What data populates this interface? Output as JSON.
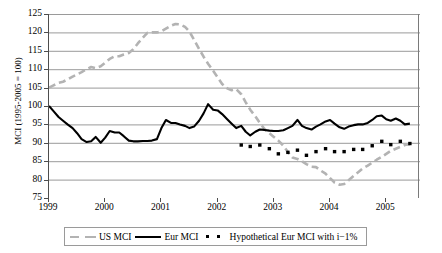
{
  "chart_data": {
    "type": "line",
    "title": "",
    "xlabel": "",
    "ylabel": "MCI (1995-2005 = 100)",
    "xlim": [
      1999,
      2005.6
    ],
    "ylim": [
      75,
      125
    ],
    "ytick_step": 5,
    "yticks": [
      125,
      120,
      115,
      110,
      105,
      100,
      95,
      90,
      85,
      80,
      75
    ],
    "xticks": [
      1999,
      2000,
      2001,
      2002,
      2003,
      2004,
      2005
    ],
    "grid": "horizontal",
    "legend_position": "bottom",
    "colors": {
      "us_mci": "#b3b3b3",
      "eur_mci": "#000000",
      "hypothetical": "#000000",
      "gridline": "#808080",
      "axis": "#4d4d4d"
    },
    "series": [
      {
        "name": "US MCI",
        "style": "dashed",
        "color": "#b3b3b3",
        "x": [
          1999.0,
          1999.08,
          1999.17,
          1999.25,
          1999.33,
          1999.42,
          1999.5,
          1999.58,
          1999.67,
          1999.75,
          1999.83,
          1999.92,
          2000.0,
          2000.08,
          2000.17,
          2000.25,
          2000.33,
          2000.42,
          2000.5,
          2000.58,
          2000.67,
          2000.75,
          2000.83,
          2000.92,
          2001.0,
          2001.08,
          2001.17,
          2001.25,
          2001.33,
          2001.42,
          2001.5,
          2001.58,
          2001.67,
          2001.75,
          2001.83,
          2001.92,
          2002.0,
          2002.08,
          2002.17,
          2002.25,
          2002.33,
          2002.42,
          2002.5,
          2002.58,
          2002.67,
          2002.75,
          2002.83,
          2002.92,
          2003.0,
          2003.08,
          2003.17,
          2003.25,
          2003.33,
          2003.42,
          2003.5,
          2003.58,
          2003.67,
          2003.75,
          2003.83,
          2003.92,
          2004.0,
          2004.08,
          2004.17,
          2004.25,
          2004.33,
          2004.42,
          2004.5,
          2004.58,
          2004.67,
          2004.75,
          2004.83,
          2004.92,
          2005.0,
          2005.08,
          2005.17,
          2005.25,
          2005.33,
          2005.42
        ],
        "values": [
          105.0,
          105.6,
          106.3,
          106.6,
          107.2,
          108.0,
          108.6,
          109.2,
          110.0,
          110.6,
          110.3,
          110.8,
          111.8,
          112.8,
          113.5,
          113.5,
          114.0,
          114.4,
          115.4,
          117.0,
          118.6,
          119.9,
          120.0,
          120.0,
          120.3,
          121.0,
          121.8,
          122.3,
          122.2,
          121.5,
          120.2,
          118.0,
          115.5,
          113.4,
          111.5,
          109.6,
          107.8,
          106.0,
          104.8,
          104.3,
          104.6,
          103.2,
          101.0,
          99.0,
          97.2,
          95.4,
          93.8,
          92.6,
          91.6,
          90.6,
          89.2,
          87.5,
          86.0,
          85.6,
          85.0,
          84.2,
          83.5,
          83.4,
          82.5,
          81.6,
          80.4,
          79.2,
          78.6,
          78.8,
          79.8,
          81.0,
          82.0,
          83.0,
          83.8,
          84.6,
          85.4,
          86.2,
          87.0,
          87.8,
          88.4,
          88.9,
          89.4,
          89.6
        ]
      },
      {
        "name": "Eur MCI",
        "style": "solid",
        "color": "#000000",
        "x": [
          1999.0,
          1999.08,
          1999.17,
          1999.25,
          1999.33,
          1999.42,
          1999.5,
          1999.58,
          1999.67,
          1999.75,
          1999.83,
          1999.92,
          2000.0,
          2000.08,
          2000.17,
          2000.25,
          2000.33,
          2000.42,
          2000.5,
          2000.58,
          2000.67,
          2000.75,
          2000.83,
          2000.92,
          2001.0,
          2001.08,
          2001.17,
          2001.25,
          2001.33,
          2001.42,
          2001.5,
          2001.58,
          2001.67,
          2001.75,
          2001.83,
          2001.92,
          2002.0,
          2002.08,
          2002.17,
          2002.25,
          2002.33,
          2002.42,
          2002.5,
          2002.58,
          2002.67,
          2002.75,
          2002.83,
          2002.92,
          2003.0,
          2003.08,
          2003.17,
          2003.25,
          2003.33,
          2003.42,
          2003.5,
          2003.58,
          2003.67,
          2003.75,
          2003.83,
          2003.92,
          2004.0,
          2004.08,
          2004.17,
          2004.25,
          2004.33,
          2004.42,
          2004.5,
          2004.58,
          2004.67,
          2004.75,
          2004.83,
          2004.92,
          2005.0,
          2005.08,
          2005.17,
          2005.25,
          2005.33,
          2005.42
        ],
        "values": [
          100.0,
          98.6,
          97.0,
          96.0,
          95.0,
          94.0,
          92.6,
          91.0,
          90.2,
          90.4,
          91.6,
          90.0,
          91.4,
          93.2,
          92.8,
          92.8,
          91.8,
          90.6,
          90.4,
          90.4,
          90.5,
          90.5,
          90.6,
          91.0,
          94.0,
          96.2,
          95.4,
          95.4,
          95.0,
          94.6,
          94.0,
          94.4,
          96.0,
          98.0,
          100.5,
          99.0,
          98.8,
          97.8,
          96.4,
          95.2,
          94.0,
          94.6,
          93.0,
          92.0,
          93.0,
          93.6,
          93.5,
          93.3,
          93.2,
          93.2,
          93.4,
          94.0,
          94.6,
          96.2,
          94.6,
          94.0,
          93.6,
          94.4,
          95.0,
          95.8,
          96.2,
          95.2,
          94.2,
          93.8,
          94.4,
          94.8,
          95.0,
          95.0,
          95.4,
          96.2,
          97.2,
          97.4,
          96.4,
          96.0,
          96.6,
          96.0,
          95.0,
          95.2
        ]
      },
      {
        "name": "Hypothetical Eur MCI with i−1%",
        "style": "dotted",
        "color": "#000000",
        "x": [
          2002.42,
          2002.5,
          2002.58,
          2002.67,
          2002.75,
          2002.83,
          2002.92,
          2003.0,
          2003.08,
          2003.17,
          2003.25,
          2003.33,
          2003.42,
          2003.5,
          2003.58,
          2003.67,
          2003.75,
          2003.83,
          2003.92,
          2004.0,
          2004.08,
          2004.17,
          2004.25,
          2004.33,
          2004.42,
          2004.5,
          2004.58,
          2004.67,
          2004.75,
          2004.83,
          2004.92,
          2005.0,
          2005.08,
          2005.17,
          2005.25,
          2005.33,
          2005.42
        ],
        "values": [
          89.4,
          89.3,
          89.0,
          89.2,
          89.4,
          89.0,
          88.4,
          87.6,
          87.0,
          86.8,
          87.4,
          88.6,
          88.0,
          87.2,
          86.6,
          87.0,
          87.6,
          88.2,
          88.4,
          88.2,
          87.6,
          87.2,
          87.6,
          88.0,
          88.2,
          88.0,
          88.2,
          88.6,
          89.2,
          89.8,
          90.4,
          90.0,
          89.5,
          90.0,
          90.4,
          89.8,
          89.8
        ]
      }
    ],
    "legend": [
      {
        "label": "US MCI",
        "marker": "dashed-gray"
      },
      {
        "label": "Eur MCI",
        "marker": "solid-black"
      },
      {
        "label": "Hypothetical Eur MCI with i−1%",
        "marker": "dotted-black"
      }
    ]
  }
}
